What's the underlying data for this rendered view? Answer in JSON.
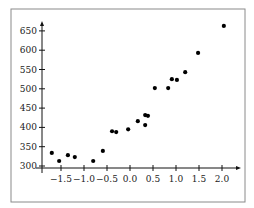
{
  "chart_data": {
    "type": "scatter",
    "title": "",
    "xlabel": "",
    "ylabel": "",
    "xlim": [
      -1.85,
      2.25
    ],
    "ylim": [
      300,
      680
    ],
    "grid": false,
    "legend": null,
    "x_ticks": [
      -1.5,
      -1.0,
      -0.5,
      0.0,
      0.5,
      1.0,
      1.5,
      2.0
    ],
    "x_tick_labels": [
      "−1.5",
      "−1.0",
      "−0.5",
      "0.0",
      "0.5",
      "1.0",
      "1.5",
      "2.0"
    ],
    "y_ticks": [
      300,
      350,
      400,
      450,
      500,
      550,
      600,
      650
    ],
    "y_tick_labels": [
      "300",
      "350",
      "400",
      "450",
      "500",
      "550",
      "600",
      "650"
    ],
    "series": [
      {
        "name": "data",
        "marker": "circle",
        "color": "#000000",
        "points": [
          {
            "x": -1.7,
            "y": 334
          },
          {
            "x": -1.54,
            "y": 313
          },
          {
            "x": -1.35,
            "y": 328
          },
          {
            "x": -1.2,
            "y": 323
          },
          {
            "x": -0.8,
            "y": 313
          },
          {
            "x": -0.59,
            "y": 339
          },
          {
            "x": -0.39,
            "y": 390
          },
          {
            "x": -0.3,
            "y": 388
          },
          {
            "x": -0.04,
            "y": 395
          },
          {
            "x": 0.17,
            "y": 416
          },
          {
            "x": 0.33,
            "y": 406
          },
          {
            "x": 0.33,
            "y": 432
          },
          {
            "x": 0.39,
            "y": 430
          },
          {
            "x": 0.54,
            "y": 502
          },
          {
            "x": 0.83,
            "y": 502
          },
          {
            "x": 0.91,
            "y": 525
          },
          {
            "x": 1.02,
            "y": 523
          },
          {
            "x": 1.2,
            "y": 543
          },
          {
            "x": 1.48,
            "y": 593
          },
          {
            "x": 2.04,
            "y": 663
          }
        ]
      }
    ]
  },
  "colors": {
    "frame": "#8a8a8a",
    "axis": "#111111",
    "marker": "#000000"
  }
}
